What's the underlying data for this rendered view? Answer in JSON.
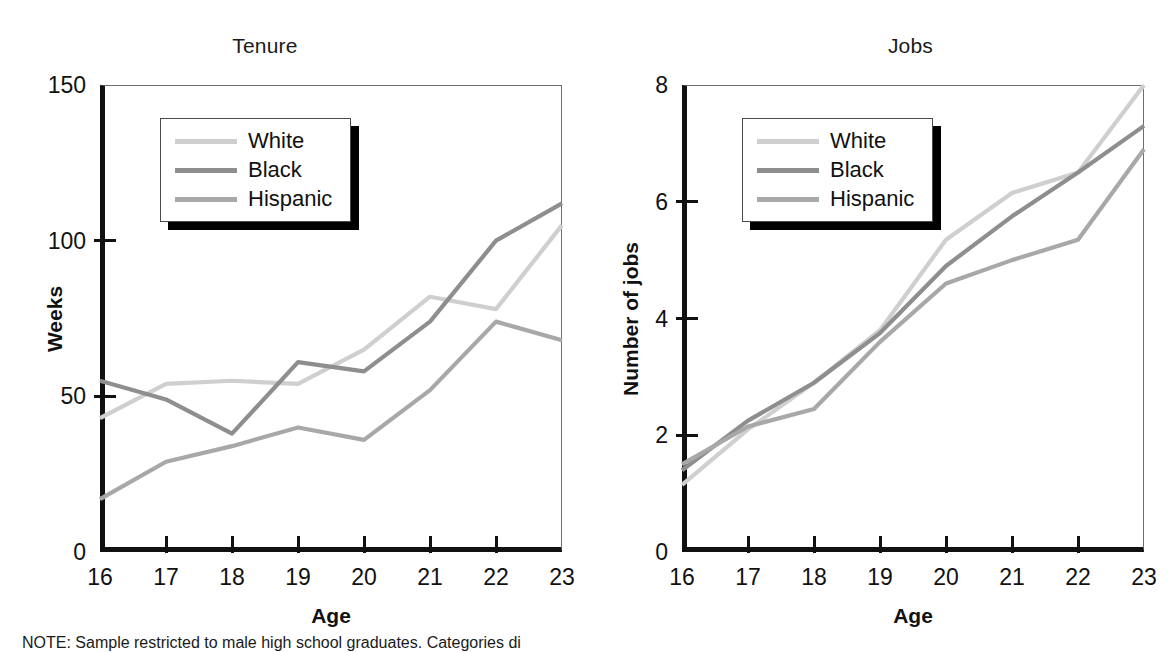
{
  "figure": {
    "note": "NOTE: Sample restricted to male high school graduates. Categories di"
  },
  "legend_series": [
    {
      "label": "White",
      "color": "#cfcfcf"
    },
    {
      "label": "Black",
      "color": "#8e8e8e"
    },
    {
      "label": "Hispanic",
      "color": "#a8a8a8"
    }
  ],
  "chart_data": [
    {
      "type": "line",
      "title": "Tenure",
      "xlabel": "Age",
      "ylabel": "Weeks",
      "x": [
        16,
        17,
        18,
        19,
        20,
        21,
        22,
        23
      ],
      "xticklabels": [
        "16",
        "17",
        "18",
        "19",
        "20",
        "21",
        "22",
        "23"
      ],
      "xlim": [
        16,
        23
      ],
      "ylim": [
        0,
        150
      ],
      "yticks": [
        0,
        50,
        100,
        150
      ],
      "yticklabels": [
        "0",
        "50",
        "100",
        "150"
      ],
      "grid": false,
      "legend_position": "upper-left",
      "series": [
        {
          "name": "White",
          "color": "#cfcfcf",
          "values": [
            43,
            54,
            55,
            54,
            65,
            82,
            78,
            105
          ]
        },
        {
          "name": "Black",
          "color": "#8e8e8e",
          "values": [
            55,
            49,
            38,
            61,
            58,
            74,
            100,
            112
          ]
        },
        {
          "name": "Hispanic",
          "color": "#a8a8a8",
          "values": [
            17,
            29,
            34,
            40,
            36,
            52,
            74,
            68
          ]
        }
      ]
    },
    {
      "type": "line",
      "title": "Jobs",
      "xlabel": "Age",
      "ylabel": "Number of jobs",
      "x": [
        16,
        17,
        18,
        19,
        20,
        21,
        22,
        23
      ],
      "xticklabels": [
        "16",
        "17",
        "18",
        "19",
        "20",
        "21",
        "22",
        "23"
      ],
      "xlim": [
        16,
        23
      ],
      "ylim": [
        0,
        8
      ],
      "yticks": [
        0,
        2,
        4,
        6,
        8
      ],
      "yticklabels": [
        "0",
        "2",
        "4",
        "6",
        "8"
      ],
      "grid": false,
      "legend_position": "upper-left",
      "series": [
        {
          "name": "White",
          "color": "#cfcfcf",
          "values": [
            1.15,
            2.1,
            2.9,
            3.8,
            5.35,
            6.15,
            6.5,
            8.0
          ]
        },
        {
          "name": "Black",
          "color": "#8e8e8e",
          "values": [
            1.4,
            2.25,
            2.9,
            3.75,
            4.9,
            5.75,
            6.5,
            7.3
          ]
        },
        {
          "name": "Hispanic",
          "color": "#a8a8a8",
          "values": [
            1.5,
            2.15,
            2.45,
            3.6,
            4.6,
            5.0,
            5.35,
            6.9
          ]
        }
      ]
    }
  ]
}
